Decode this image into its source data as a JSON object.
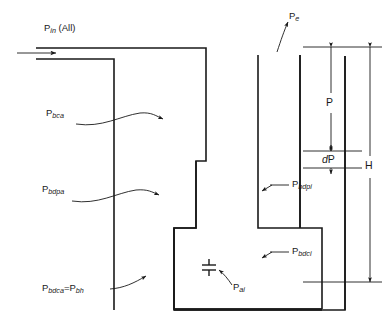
{
  "figure": {
    "type": "engineering-cross-section",
    "background_color": "#ffffff",
    "line_color": "#1a1a1a"
  },
  "labels": {
    "inlet": {
      "base": "P",
      "sub": "in",
      "suffix": " (All)"
    },
    "exit": {
      "base": "P",
      "sub": "e",
      "suffix": ""
    },
    "bca": {
      "base": "P",
      "sub": "bca",
      "suffix": ""
    },
    "bdpa": {
      "base": "P",
      "sub": "bdpa",
      "suffix": ""
    },
    "bdca_bh": {
      "base": "P",
      "sub": "bdca",
      "mid": "=P",
      "sub2": "bh",
      "suffix": ""
    },
    "ai": {
      "base": "P",
      "sub": "ai",
      "suffix": ""
    },
    "bdpi": {
      "base": "P",
      "sub": "bdpi",
      "suffix": ""
    },
    "bdci": {
      "base": "P",
      "sub": "bdci",
      "suffix": ""
    }
  },
  "dimensions": {
    "pressure_head": {
      "text": "P",
      "italic": false
    },
    "delta_pressure": {
      "text_italic": "d",
      "text_roman": "P"
    },
    "total_height": {
      "text": "H",
      "italic": false
    }
  },
  "symbols": {
    "inlet_flow_arrow": "arrow-right",
    "exit_flow_arrow": "curved-arrow-up",
    "orifice": "orifice-symbol"
  }
}
